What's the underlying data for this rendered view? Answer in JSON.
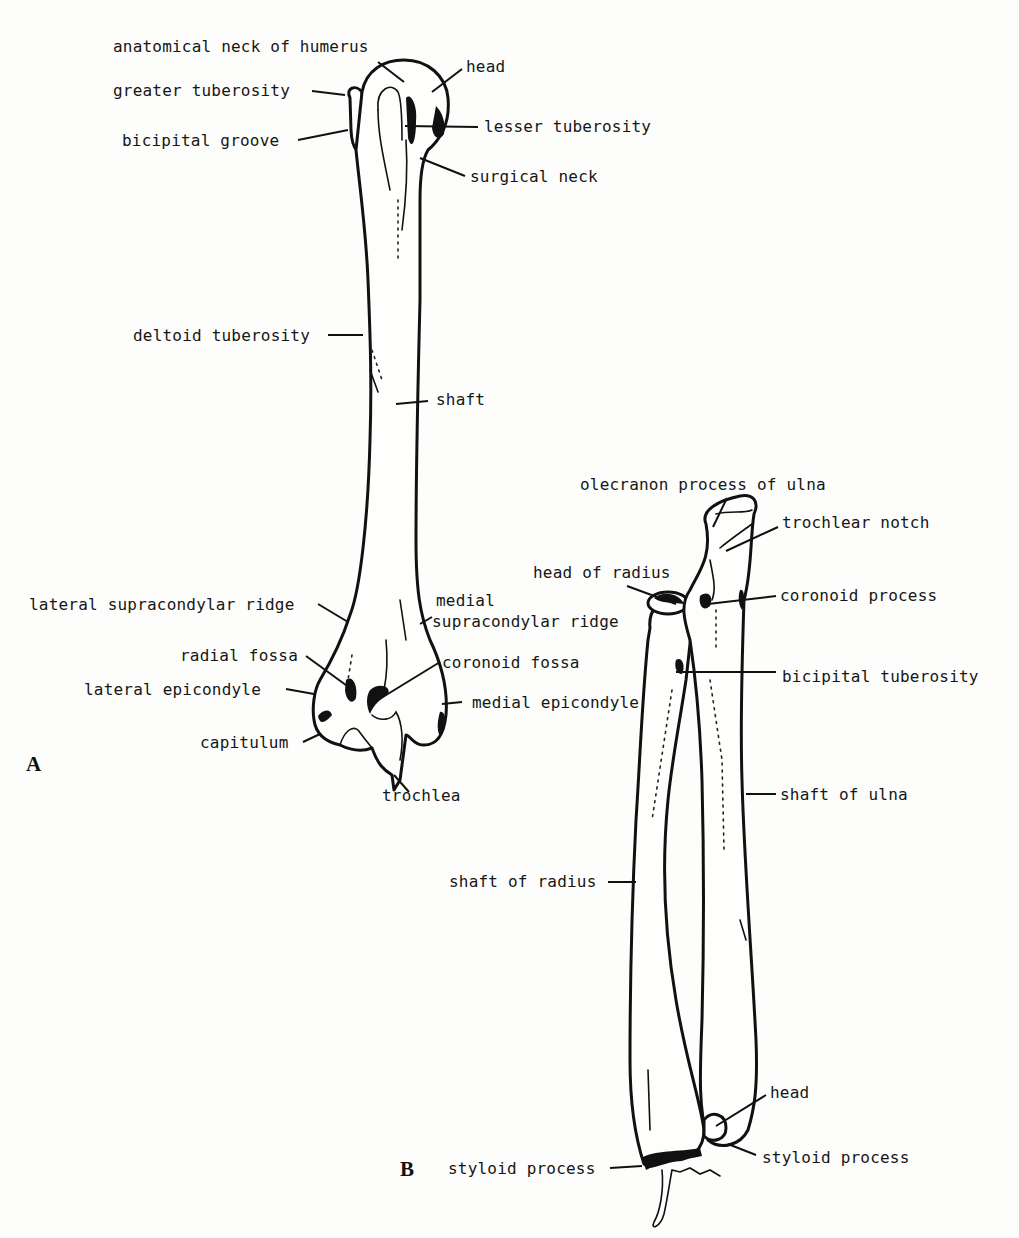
{
  "figures": {
    "A": {
      "letter": "A",
      "bone": "humerus",
      "labels": {
        "anatomical_neck": "anatomical neck of humerus",
        "head": "head",
        "greater_tuberosity": "greater tuberosity",
        "lesser_tuberosity": "lesser tuberosity",
        "bicipital_groove": "bicipital groove",
        "surgical_neck": "surgical neck",
        "deltoid_tuberosity": "deltoid tuberosity",
        "shaft": "shaft",
        "lateral_supracondylar_ridge": "lateral supracondylar ridge",
        "medial_supracondylar_ridge_1": "medial",
        "medial_supracondylar_ridge_2": "supracondylar ridge",
        "radial_fossa": "radial fossa",
        "coronoid_fossa": "coronoid fossa",
        "lateral_epicondyle": "lateral epicondyle",
        "medial_epicondyle": "medial epicondyle",
        "capitulum": "capitulum",
        "trochlea": "trochlea"
      }
    },
    "B": {
      "letter": "B",
      "bone": "radius and ulna",
      "labels": {
        "olecranon": "olecranon process of ulna",
        "trochlear_notch": "trochlear notch",
        "head_of_radius": "head of radius",
        "coronoid_process": "coronoid process",
        "bicipital_tuberosity": "bicipital tuberosity",
        "shaft_of_ulna": "shaft of ulna",
        "shaft_of_radius": "shaft of radius",
        "head": "head",
        "styloid_process_radius": "styloid process",
        "styloid_process_ulna": "styloid process"
      }
    }
  },
  "signature": "Graeber"
}
